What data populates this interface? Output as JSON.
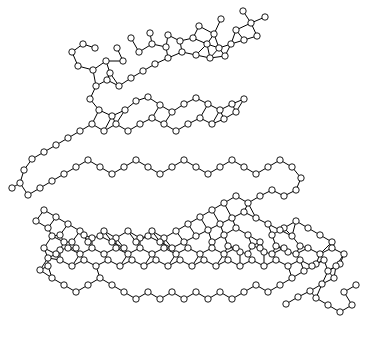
{
  "viewer": {
    "title": "molecular-structure-diagram",
    "width": 365,
    "height": 345,
    "background_color": "#ffffff",
    "bond_color": "#000000",
    "atom_fill_color": "#ffffff",
    "atom_stroke_color": "#000000",
    "render_style": "ball-and-stick wireframe",
    "atom_radius": 3.2,
    "bond_width": 1
  },
  "structure": {
    "description": "Wireframe ball-and-stick rendering of a nucleic-acid-like double-stranded molecule with phosphate backbones, sugar rings and stacked base pairs",
    "atom_count": 247,
    "bond_count": 272
  },
  "chart_data": {
    "type": "scatter",
    "title": "",
    "xlabel": "",
    "ylabel": "",
    "grid": false,
    "legend": "none",
    "xlim": [
      0,
      365
    ],
    "ylim": [
      0,
      345
    ],
    "atoms": [
      [
        243,
        11
      ],
      [
        221,
        19
      ],
      [
        199,
        26
      ],
      [
        214,
        34
      ],
      [
        236,
        30
      ],
      [
        251,
        23
      ],
      [
        265,
        17
      ],
      [
        168,
        35
      ],
      [
        150,
        33
      ],
      [
        131,
        38
      ],
      [
        117,
        48
      ],
      [
        106,
        61
      ],
      [
        95,
        48
      ],
      [
        83,
        44
      ],
      [
        72,
        52
      ],
      [
        78,
        66
      ],
      [
        93,
        70
      ],
      [
        110,
        73
      ],
      [
        123,
        61
      ],
      [
        139,
        52
      ],
      [
        152,
        44
      ],
      [
        166,
        47
      ],
      [
        180,
        41
      ],
      [
        193,
        38
      ],
      [
        207,
        44
      ],
      [
        219,
        48
      ],
      [
        231,
        44
      ],
      [
        244,
        40
      ],
      [
        257,
        36
      ],
      [
        225,
        56
      ],
      [
        210,
        58
      ],
      [
        196,
        55
      ],
      [
        182,
        52
      ],
      [
        168,
        58
      ],
      [
        155,
        64
      ],
      [
        143,
        71
      ],
      [
        131,
        78
      ],
      [
        119,
        86
      ],
      [
        107,
        80
      ],
      [
        96,
        86
      ],
      [
        90,
        99
      ],
      [
        99,
        110
      ],
      [
        112,
        116
      ],
      [
        125,
        110
      ],
      [
        136,
        101
      ],
      [
        148,
        97
      ],
      [
        160,
        105
      ],
      [
        172,
        112
      ],
      [
        184,
        104
      ],
      [
        196,
        98
      ],
      [
        208,
        104
      ],
      [
        220,
        110
      ],
      [
        232,
        104
      ],
      [
        244,
        99
      ],
      [
        236,
        112
      ],
      [
        224,
        119
      ],
      [
        212,
        124
      ],
      [
        200,
        118
      ],
      [
        188,
        124
      ],
      [
        176,
        131
      ],
      [
        164,
        124
      ],
      [
        152,
        118
      ],
      [
        140,
        124
      ],
      [
        128,
        131
      ],
      [
        116,
        124
      ],
      [
        104,
        131
      ],
      [
        92,
        124
      ],
      [
        80,
        131
      ],
      [
        68,
        138
      ],
      [
        56,
        145
      ],
      [
        44,
        152
      ],
      [
        32,
        159
      ],
      [
        24,
        170
      ],
      [
        20,
        183
      ],
      [
        12,
        188
      ],
      [
        28,
        195
      ],
      [
        40,
        188
      ],
      [
        52,
        181
      ],
      [
        64,
        174
      ],
      [
        76,
        167
      ],
      [
        88,
        160
      ],
      [
        100,
        167
      ],
      [
        112,
        174
      ],
      [
        124,
        167
      ],
      [
        136,
        160
      ],
      [
        148,
        167
      ],
      [
        160,
        174
      ],
      [
        172,
        167
      ],
      [
        184,
        160
      ],
      [
        196,
        167
      ],
      [
        208,
        174
      ],
      [
        220,
        167
      ],
      [
        232,
        160
      ],
      [
        244,
        167
      ],
      [
        256,
        174
      ],
      [
        268,
        167
      ],
      [
        280,
        160
      ],
      [
        292,
        167
      ],
      [
        301,
        178
      ],
      [
        296,
        190
      ],
      [
        284,
        196
      ],
      [
        272,
        190
      ],
      [
        260,
        196
      ],
      [
        248,
        203
      ],
      [
        236,
        196
      ],
      [
        224,
        203
      ],
      [
        212,
        210
      ],
      [
        200,
        217
      ],
      [
        188,
        224
      ],
      [
        176,
        231
      ],
      [
        164,
        238
      ],
      [
        152,
        231
      ],
      [
        140,
        238
      ],
      [
        128,
        231
      ],
      [
        116,
        238
      ],
      [
        104,
        231
      ],
      [
        92,
        238
      ],
      [
        80,
        231
      ],
      [
        68,
        224
      ],
      [
        56,
        217
      ],
      [
        44,
        210
      ],
      [
        36,
        221
      ],
      [
        48,
        228
      ],
      [
        60,
        235
      ],
      [
        72,
        242
      ],
      [
        84,
        235
      ],
      [
        60,
        250
      ],
      [
        48,
        258
      ],
      [
        40,
        270
      ],
      [
        52,
        278
      ],
      [
        64,
        285
      ],
      [
        76,
        292
      ],
      [
        88,
        285
      ],
      [
        100,
        278
      ],
      [
        112,
        285
      ],
      [
        124,
        292
      ],
      [
        136,
        299
      ],
      [
        148,
        292
      ],
      [
        160,
        299
      ],
      [
        172,
        292
      ],
      [
        184,
        299
      ],
      [
        196,
        292
      ],
      [
        208,
        299
      ],
      [
        220,
        292
      ],
      [
        232,
        299
      ],
      [
        244,
        292
      ],
      [
        256,
        285
      ],
      [
        268,
        292
      ],
      [
        280,
        285
      ],
      [
        292,
        278
      ],
      [
        304,
        271
      ],
      [
        316,
        264
      ],
      [
        328,
        271
      ],
      [
        340,
        264
      ],
      [
        334,
        278
      ],
      [
        322,
        284
      ],
      [
        310,
        291
      ],
      [
        298,
        297
      ],
      [
        286,
        304
      ],
      [
        316,
        298
      ],
      [
        328,
        305
      ],
      [
        340,
        312
      ],
      [
        352,
        305
      ],
      [
        344,
        292
      ],
      [
        356,
        285
      ],
      [
        332,
        242
      ],
      [
        320,
        235
      ],
      [
        308,
        228
      ],
      [
        296,
        221
      ],
      [
        284,
        228
      ],
      [
        272,
        235
      ],
      [
        260,
        242
      ],
      [
        248,
        235
      ],
      [
        236,
        228
      ],
      [
        224,
        235
      ],
      [
        212,
        242
      ],
      [
        228,
        246
      ],
      [
        240,
        252
      ],
      [
        252,
        246
      ],
      [
        264,
        252
      ],
      [
        276,
        246
      ],
      [
        288,
        252
      ],
      [
        300,
        246
      ],
      [
        292,
        236
      ],
      [
        280,
        230
      ],
      [
        268,
        224
      ],
      [
        256,
        218
      ],
      [
        244,
        212
      ],
      [
        232,
        218
      ],
      [
        220,
        224
      ],
      [
        208,
        230
      ],
      [
        196,
        236
      ],
      [
        184,
        242
      ],
      [
        172,
        248
      ],
      [
        160,
        242
      ],
      [
        148,
        236
      ],
      [
        136,
        242
      ],
      [
        124,
        248
      ],
      [
        112,
        242
      ],
      [
        100,
        236
      ],
      [
        88,
        242
      ],
      [
        76,
        248
      ],
      [
        64,
        242
      ],
      [
        52,
        236
      ],
      [
        44,
        248
      ],
      [
        56,
        254
      ],
      [
        68,
        248
      ],
      [
        80,
        254
      ],
      [
        92,
        248
      ],
      [
        104,
        254
      ],
      [
        116,
        248
      ],
      [
        128,
        254
      ],
      [
        140,
        248
      ],
      [
        152,
        254
      ],
      [
        164,
        248
      ],
      [
        176,
        254
      ],
      [
        188,
        248
      ],
      [
        200,
        254
      ],
      [
        212,
        248
      ],
      [
        224,
        254
      ],
      [
        236,
        248
      ],
      [
        248,
        254
      ],
      [
        260,
        248
      ],
      [
        272,
        254
      ],
      [
        284,
        248
      ],
      [
        296,
        254
      ],
      [
        308,
        248
      ],
      [
        320,
        254
      ],
      [
        332,
        248
      ],
      [
        344,
        254
      ],
      [
        336,
        266
      ],
      [
        324,
        260
      ],
      [
        312,
        266
      ],
      [
        300,
        260
      ],
      [
        288,
        266
      ],
      [
        276,
        260
      ],
      [
        264,
        266
      ],
      [
        252,
        260
      ],
      [
        240,
        266
      ],
      [
        228,
        260
      ],
      [
        216,
        266
      ],
      [
        204,
        260
      ],
      [
        192,
        266
      ],
      [
        180,
        260
      ],
      [
        168,
        266
      ],
      [
        156,
        260
      ],
      [
        144,
        266
      ],
      [
        132,
        260
      ],
      [
        120,
        266
      ],
      [
        108,
        260
      ],
      [
        96,
        266
      ],
      [
        84,
        260
      ],
      [
        72,
        266
      ],
      [
        60,
        260
      ],
      [
        48,
        266
      ]
    ]
  }
}
